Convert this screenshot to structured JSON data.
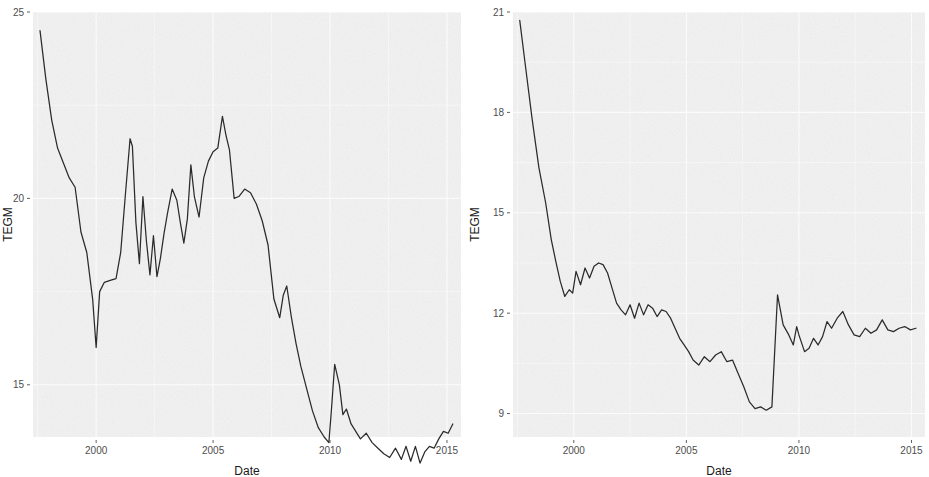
{
  "figure": {
    "background_color": "#ffffff",
    "panel_color": "#f2f2f2",
    "grid_color": "#ffffff",
    "line_color": "#2b2b2b",
    "axis_text_color": "#4d4d4d"
  },
  "chart_data": [
    {
      "type": "line",
      "panel": "left",
      "title": "",
      "xlabel": "Date",
      "ylabel": "TEGM",
      "xlim": [
        1997.3,
        2015.6
      ],
      "ylim": [
        13.6,
        25.0
      ],
      "grid": true,
      "legend": "none",
      "xticks": [
        2000,
        2005,
        2010,
        2015
      ],
      "xticklabels": [
        "2000",
        "2005",
        "2010",
        "2015"
      ],
      "yticks": [
        15,
        20,
        25
      ],
      "yticklabels": [
        "15",
        "20",
        "25"
      ],
      "xminor": [
        1997.5,
        2002.5,
        2007.5,
        2012.5
      ],
      "yminor": [
        17.5,
        22.5
      ],
      "series": [
        {
          "name": "TEGM",
          "x": [
            1997.6,
            1997.85,
            1998.1,
            1998.35,
            1998.6,
            1998.85,
            1999.1,
            1999.35,
            1999.6,
            1999.85,
            2000.0,
            2000.15,
            2000.35,
            2000.6,
            2000.85,
            2001.05,
            2001.25,
            2001.45,
            2001.55,
            2001.7,
            2001.85,
            2002.0,
            2002.15,
            2002.3,
            2002.45,
            2002.6,
            2002.75,
            2002.9,
            2003.05,
            2003.25,
            2003.45,
            2003.6,
            2003.75,
            2003.9,
            2004.05,
            2004.2,
            2004.4,
            2004.6,
            2004.8,
            2005.0,
            2005.2,
            2005.4,
            2005.55,
            2005.7,
            2005.9,
            2006.1,
            2006.35,
            2006.6,
            2006.85,
            2007.1,
            2007.35,
            2007.6,
            2007.85,
            2008.0,
            2008.15,
            2008.35,
            2008.55,
            2008.75,
            2009.0,
            2009.25,
            2009.5,
            2009.75,
            2009.95,
            2010.05,
            2010.2,
            2010.4,
            2010.55,
            2010.7,
            2010.9,
            2011.1,
            2011.3,
            2011.55,
            2011.8,
            2012.05,
            2012.3,
            2012.55,
            2012.8,
            2013.05,
            2013.25,
            2013.45,
            2013.65,
            2013.85,
            2014.05,
            2014.25,
            2014.45,
            2014.65,
            2014.85,
            2015.05,
            2015.25
          ],
          "y": [
            24.5,
            23.2,
            22.1,
            21.35,
            20.95,
            20.55,
            20.3,
            19.1,
            18.55,
            17.3,
            16.0,
            17.5,
            17.75,
            17.8,
            17.85,
            18.55,
            20.1,
            21.6,
            21.4,
            19.35,
            18.25,
            20.05,
            18.85,
            17.95,
            19.0,
            17.9,
            18.4,
            19.05,
            19.6,
            20.25,
            19.95,
            19.35,
            18.8,
            19.45,
            20.9,
            20.05,
            19.5,
            20.55,
            21.0,
            21.25,
            21.35,
            22.2,
            21.7,
            21.3,
            20.0,
            20.05,
            20.25,
            20.15,
            19.85,
            19.4,
            18.75,
            17.3,
            16.8,
            17.4,
            17.65,
            16.8,
            16.1,
            15.5,
            14.9,
            14.3,
            13.85,
            13.6,
            13.45,
            14.25,
            15.55,
            15.0,
            14.2,
            14.35,
            13.95,
            13.75,
            13.55,
            13.7,
            13.45,
            13.3,
            13.15,
            13.05,
            13.3,
            13.0,
            13.35,
            12.95,
            13.35,
            12.9,
            13.2,
            13.35,
            13.3,
            13.55,
            13.75,
            13.7,
            13.95
          ]
        }
      ]
    },
    {
      "type": "line",
      "panel": "right",
      "title": "",
      "xlabel": "Date",
      "ylabel": "TEGM",
      "xlim": [
        1997.3,
        2015.6
      ],
      "ylim": [
        8.3,
        21.0
      ],
      "grid": true,
      "legend": "none",
      "xticks": [
        2000,
        2005,
        2010,
        2015
      ],
      "xticklabels": [
        "2000",
        "2005",
        "2010",
        "2015"
      ],
      "yticks": [
        9,
        12,
        15,
        18,
        21
      ],
      "yticklabels": [
        "9",
        "12",
        "15",
        "18",
        "21"
      ],
      "xminor": [
        1997.5,
        2002.5,
        2007.5,
        2012.5
      ],
      "yminor": [
        10.5,
        13.5,
        16.5,
        19.5
      ],
      "series": [
        {
          "name": "TEGM",
          "x": [
            1997.6,
            1997.85,
            1998.15,
            1998.45,
            1998.75,
            1999.0,
            1999.2,
            1999.4,
            1999.6,
            1999.8,
            1999.95,
            2000.1,
            2000.3,
            2000.5,
            2000.7,
            2000.9,
            2001.1,
            2001.3,
            2001.5,
            2001.7,
            2001.9,
            2002.1,
            2002.3,
            2002.5,
            2002.7,
            2002.9,
            2003.1,
            2003.3,
            2003.5,
            2003.7,
            2003.9,
            2004.1,
            2004.3,
            2004.5,
            2004.7,
            2004.9,
            2005.1,
            2005.3,
            2005.55,
            2005.8,
            2006.05,
            2006.3,
            2006.55,
            2006.8,
            2007.05,
            2007.3,
            2007.55,
            2007.8,
            2008.05,
            2008.3,
            2008.55,
            2008.8,
            2009.05,
            2009.3,
            2009.55,
            2009.75,
            2009.9,
            2010.0,
            2010.1,
            2010.25,
            2010.45,
            2010.65,
            2010.85,
            2011.05,
            2011.25,
            2011.45,
            2011.7,
            2011.95,
            2012.2,
            2012.45,
            2012.7,
            2012.95,
            2013.2,
            2013.45,
            2013.7,
            2013.95,
            2014.2,
            2014.45,
            2014.7,
            2014.95,
            2015.2
          ],
          "y": [
            20.75,
            19.4,
            17.8,
            16.35,
            15.3,
            14.2,
            13.55,
            12.95,
            12.5,
            12.7,
            12.6,
            13.25,
            12.85,
            13.35,
            13.05,
            13.4,
            13.5,
            13.45,
            13.2,
            12.75,
            12.3,
            12.1,
            11.95,
            12.25,
            11.85,
            12.3,
            11.95,
            12.25,
            12.15,
            11.9,
            12.1,
            12.05,
            11.85,
            11.55,
            11.25,
            11.05,
            10.85,
            10.6,
            10.45,
            10.7,
            10.55,
            10.75,
            10.85,
            10.55,
            10.6,
            10.2,
            9.8,
            9.35,
            9.15,
            9.2,
            9.1,
            9.2,
            12.55,
            11.65,
            11.35,
            11.05,
            11.6,
            11.35,
            11.15,
            10.85,
            10.95,
            11.25,
            11.05,
            11.3,
            11.75,
            11.55,
            11.85,
            12.05,
            11.65,
            11.35,
            11.3,
            11.55,
            11.4,
            11.5,
            11.8,
            11.5,
            11.45,
            11.55,
            11.6,
            11.5,
            11.55
          ]
        }
      ]
    }
  ]
}
